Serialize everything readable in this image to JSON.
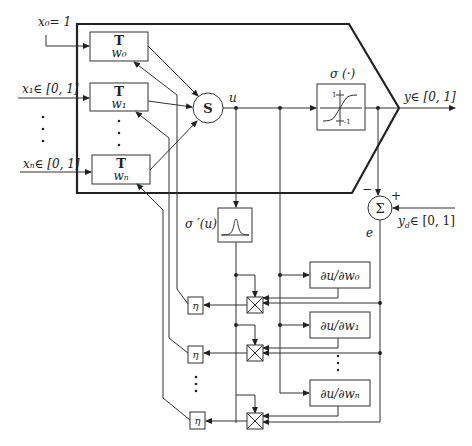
{
  "diagram": {
    "inputs": [
      {
        "label": "x₀= 1"
      },
      {
        "label": "x₁∈ [0, 1]"
      },
      {
        "label": "xₙ∈ [0, 1]"
      }
    ],
    "weight_blocks": [
      {
        "op": "T",
        "weight": "w₀"
      },
      {
        "op": "T",
        "weight": "w₁"
      },
      {
        "op": "T",
        "weight": "wₙ"
      }
    ],
    "sum_node": {
      "label": "S"
    },
    "net_signal": {
      "label": "u"
    },
    "activation": {
      "label": "σ (·)",
      "tick_high": "1",
      "tick_low": "-1"
    },
    "output": {
      "label": "y∈ [0, 1]"
    },
    "error_sum": {
      "label": "Σ",
      "minus": "−",
      "plus": "+",
      "error_label": "e"
    },
    "desired": {
      "label": "y_d∈ [0, 1]",
      "main": "y",
      "sub": "d",
      "rest": "∈ [0, 1]"
    },
    "derivative": {
      "label": "σ ′(u)"
    },
    "partials": [
      {
        "label": "∂u/∂w₀"
      },
      {
        "label": "∂u/∂w₁"
      },
      {
        "label": "∂u/∂wₙ"
      }
    ],
    "learning_rate": [
      {
        "label": "η"
      },
      {
        "label": "η"
      },
      {
        "label": "η"
      }
    ],
    "ellipsis": "⋮"
  }
}
